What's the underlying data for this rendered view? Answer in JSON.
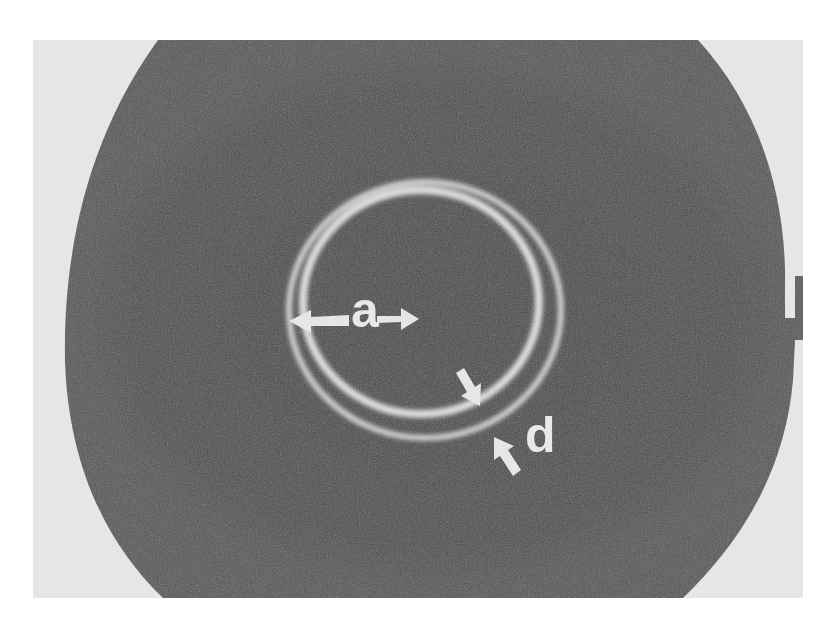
{
  "figure": {
    "colors": {
      "background": "#e6e6e6",
      "disc": "#4a4a4a",
      "ring": "#d8d8d8",
      "label": "#e8e8e8"
    },
    "labels": {
      "radius_label": "a",
      "width_label": "d"
    }
  }
}
